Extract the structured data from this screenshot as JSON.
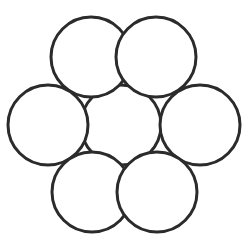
{
  "figure": {
    "name": "hexagonal-circle-packing",
    "width": 252,
    "height": 244,
    "background_color": "#ffffff",
    "stroke_color": "#2b2b2b",
    "fill_color": "#ffffff",
    "stroke_width": 3,
    "circle_count": 7,
    "radius": 40
  },
  "chart_data": {
    "type": "scatter",
    "xlabel": "",
    "ylabel": "",
    "xlim": [
      0,
      252
    ],
    "ylim": [
      0,
      244
    ],
    "grid": false,
    "legend": "none",
    "shared_radius": 40,
    "circles": [
      {
        "id": "center",
        "label": "Center circle",
        "cx": 121,
        "cy": 125,
        "r": 40
      },
      {
        "id": "top-left",
        "label": "Top-left circle",
        "cx": 91,
        "cy": 57,
        "r": 40
      },
      {
        "id": "top-right",
        "label": "Top-right circle",
        "cx": 156,
        "cy": 57,
        "r": 40
      },
      {
        "id": "left",
        "label": "Left circle",
        "cx": 48,
        "cy": 125,
        "r": 40
      },
      {
        "id": "right",
        "label": "Right circle",
        "cx": 200,
        "cy": 125,
        "r": 40
      },
      {
        "id": "bottom-left",
        "label": "Bottom-left circle",
        "cx": 92,
        "cy": 192,
        "r": 40
      },
      {
        "id": "bottom-right",
        "label": "Bottom-right circle",
        "cx": 157,
        "cy": 192,
        "r": 40
      }
    ]
  }
}
